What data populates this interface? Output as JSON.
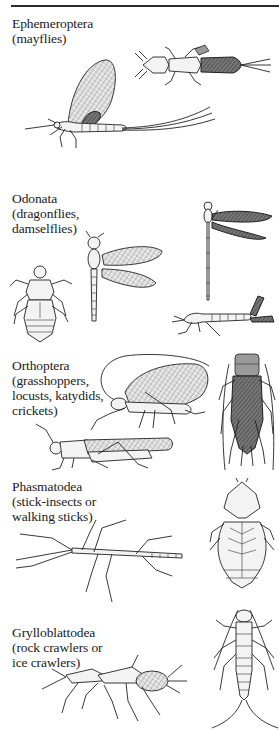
{
  "page": {
    "type": "textbook figure page"
  },
  "sections": [
    {
      "order": "Ephemeroptera",
      "common": "(mayflies)",
      "figures": [
        "mayfly-adult",
        "mayfly-nymph"
      ]
    },
    {
      "order": "Odonata",
      "common_lines": [
        "(dragonflies,",
        "damselflies)"
      ],
      "figures": [
        "dragonfly-nymph",
        "dragonfly-adult",
        "damselfly-adult",
        "damselfly-nymph"
      ]
    },
    {
      "order": "Orthoptera",
      "common_lines": [
        "(grasshoppers,",
        "locusts, katydids,",
        "crickets)"
      ],
      "figures": [
        "katydid",
        "grasshopper",
        "cricket"
      ]
    },
    {
      "order": "Phasmatodea",
      "common_lines": [
        "(stick-insects or",
        "walking sticks)"
      ],
      "figures": [
        "stick-insect",
        "leaf-insect"
      ]
    },
    {
      "order": "Grylloblattodea",
      "common_lines": [
        "(rock crawlers or",
        "ice crawlers)"
      ],
      "figures": [
        "rock-crawler-pair",
        "rock-crawler-dorsal"
      ]
    }
  ]
}
